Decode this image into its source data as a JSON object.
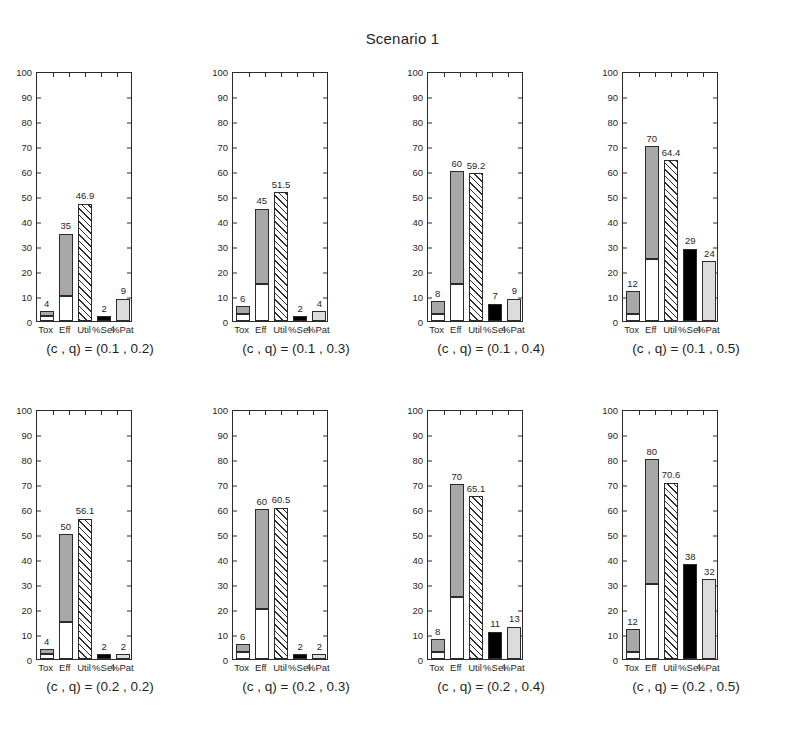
{
  "figure": {
    "title": "Scenario 1"
  },
  "axis": {
    "yticks": [
      "0",
      "10",
      "20",
      "30",
      "40",
      "50",
      "60",
      "70",
      "80",
      "90",
      "100"
    ],
    "ylim": [
      0,
      100
    ],
    "xticklabels": [
      "Tox",
      "Eff",
      "Util",
      "%Sel",
      "%Pat"
    ]
  },
  "colors": {
    "white": "#ffffff",
    "gray": "#a8a8a8",
    "black": "#000000",
    "light_gray": "#dcdcdc",
    "axis": "#2b2b2b"
  },
  "chart_data": {
    "type": "bar",
    "title": "Scenario 1",
    "xlabel": "",
    "ylabel": "",
    "ylim": [
      0,
      100
    ],
    "grid": false,
    "legend": "none",
    "categories": [
      "Tox",
      "Eff",
      "Util",
      "%Sel",
      "%Pat"
    ],
    "panel_layout": {
      "rows": 2,
      "cols": 4
    },
    "panels": [
      {
        "caption": "(c , q) = (0.1 , 0.2)",
        "c": 0.1,
        "q": 0.2,
        "bars": [
          {
            "category": "Tox",
            "label": "4",
            "total": 4,
            "style": "stacked",
            "base": 2,
            "base_style": "white",
            "top_style": "gray"
          },
          {
            "category": "Eff",
            "label": "35",
            "total": 35,
            "style": "stacked",
            "base": 10,
            "base_style": "white",
            "top_style": "gray"
          },
          {
            "category": "Util",
            "label": "46.9",
            "total": 46.9,
            "style": "hatch"
          },
          {
            "category": "%Sel",
            "label": "2",
            "total": 2,
            "style": "black"
          },
          {
            "category": "%Pat",
            "label": "9",
            "total": 9,
            "style": "light"
          }
        ]
      },
      {
        "caption": "(c , q) = (0.1 , 0.3)",
        "c": 0.1,
        "q": 0.3,
        "bars": [
          {
            "category": "Tox",
            "label": "6",
            "total": 6,
            "style": "stacked",
            "base": 3,
            "base_style": "white",
            "top_style": "gray"
          },
          {
            "category": "Eff",
            "label": "45",
            "total": 45,
            "style": "stacked",
            "base": 15,
            "base_style": "white",
            "top_style": "gray"
          },
          {
            "category": "Util",
            "label": "51.5",
            "total": 51.5,
            "style": "hatch"
          },
          {
            "category": "%Sel",
            "label": "2",
            "total": 2,
            "style": "black"
          },
          {
            "category": "%Pat",
            "label": "4",
            "total": 4,
            "style": "light"
          }
        ]
      },
      {
        "caption": "(c , q) = (0.1 , 0.4)",
        "c": 0.1,
        "q": 0.4,
        "bars": [
          {
            "category": "Tox",
            "label": "8",
            "total": 8,
            "style": "stacked",
            "base": 3,
            "base_style": "white",
            "top_style": "gray"
          },
          {
            "category": "Eff",
            "label": "60",
            "total": 60,
            "style": "stacked",
            "base": 15,
            "base_style": "white",
            "top_style": "gray"
          },
          {
            "category": "Util",
            "label": "59.2",
            "total": 59.2,
            "style": "hatch"
          },
          {
            "category": "%Sel",
            "label": "7",
            "total": 7,
            "style": "black"
          },
          {
            "category": "%Pat",
            "label": "9",
            "total": 9,
            "style": "light"
          }
        ]
      },
      {
        "caption": "(c , q) = (0.1 , 0.5)",
        "c": 0.1,
        "q": 0.5,
        "bars": [
          {
            "category": "Tox",
            "label": "12",
            "total": 12,
            "style": "stacked",
            "base": 3,
            "base_style": "white",
            "top_style": "gray"
          },
          {
            "category": "Eff",
            "label": "70",
            "total": 70,
            "style": "stacked",
            "base": 25,
            "base_style": "white",
            "top_style": "gray"
          },
          {
            "category": "Util",
            "label": "64.4",
            "total": 64.4,
            "style": "hatch"
          },
          {
            "category": "%Sel",
            "label": "29",
            "total": 29,
            "style": "black"
          },
          {
            "category": "%Pat",
            "label": "24",
            "total": 24,
            "style": "light"
          }
        ]
      },
      {
        "caption": "(c , q) = (0.2 , 0.2)",
        "c": 0.2,
        "q": 0.2,
        "bars": [
          {
            "category": "Tox",
            "label": "4",
            "total": 4,
            "style": "stacked",
            "base": 2,
            "base_style": "white",
            "top_style": "gray"
          },
          {
            "category": "Eff",
            "label": "50",
            "total": 50,
            "style": "stacked",
            "base": 15,
            "base_style": "white",
            "top_style": "gray"
          },
          {
            "category": "Util",
            "label": "56.1",
            "total": 56.1,
            "style": "hatch"
          },
          {
            "category": "%Sel",
            "label": "2",
            "total": 2,
            "style": "black"
          },
          {
            "category": "%Pat",
            "label": "2",
            "total": 2,
            "style": "light"
          }
        ]
      },
      {
        "caption": "(c , q) = (0.2 , 0.3)",
        "c": 0.2,
        "q": 0.3,
        "bars": [
          {
            "category": "Tox",
            "label": "6",
            "total": 6,
            "style": "stacked",
            "base": 3,
            "base_style": "white",
            "top_style": "gray"
          },
          {
            "category": "Eff",
            "label": "60",
            "total": 60,
            "style": "stacked",
            "base": 20,
            "base_style": "white",
            "top_style": "gray"
          },
          {
            "category": "Util",
            "label": "60.5",
            "total": 60.5,
            "style": "hatch"
          },
          {
            "category": "%Sel",
            "label": "2",
            "total": 2,
            "style": "black"
          },
          {
            "category": "%Pat",
            "label": "2",
            "total": 2,
            "style": "light"
          }
        ]
      },
      {
        "caption": "(c , q) = (0.2 , 0.4)",
        "c": 0.2,
        "q": 0.4,
        "bars": [
          {
            "category": "Tox",
            "label": "8",
            "total": 8,
            "style": "stacked",
            "base": 3,
            "base_style": "white",
            "top_style": "gray"
          },
          {
            "category": "Eff",
            "label": "70",
            "total": 70,
            "style": "stacked",
            "base": 25,
            "base_style": "white",
            "top_style": "gray"
          },
          {
            "category": "Util",
            "label": "65.1",
            "total": 65.1,
            "style": "hatch"
          },
          {
            "category": "%Sel",
            "label": "11",
            "total": 11,
            "style": "black"
          },
          {
            "category": "%Pat",
            "label": "13",
            "total": 13,
            "style": "light"
          }
        ]
      },
      {
        "caption": "(c , q) = (0.2 , 0.5)",
        "c": 0.2,
        "q": 0.5,
        "bars": [
          {
            "category": "Tox",
            "label": "12",
            "total": 12,
            "style": "stacked",
            "base": 3,
            "base_style": "white",
            "top_style": "gray"
          },
          {
            "category": "Eff",
            "label": "80",
            "total": 80,
            "style": "stacked",
            "base": 30,
            "base_style": "white",
            "top_style": "gray"
          },
          {
            "category": "Util",
            "label": "70.6",
            "total": 70.6,
            "style": "hatch"
          },
          {
            "category": "%Sel",
            "label": "38",
            "total": 38,
            "style": "black"
          },
          {
            "category": "%Pat",
            "label": "32",
            "total": 32,
            "style": "light"
          }
        ]
      }
    ]
  }
}
